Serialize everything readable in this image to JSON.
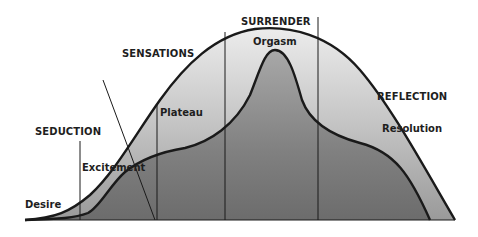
{
  "diagram": {
    "phases": [
      {
        "id": "seduction",
        "label": "SEDUCTION"
      },
      {
        "id": "sensations",
        "label": "SENSATIONS"
      },
      {
        "id": "surrender",
        "label": "SURRENDER"
      },
      {
        "id": "reflection",
        "label": "REFLECTION"
      }
    ],
    "stages": [
      {
        "id": "desire",
        "label": "Desire"
      },
      {
        "id": "excitement",
        "label": "Excitement"
      },
      {
        "id": "plateau",
        "label": "Plateau"
      },
      {
        "id": "orgasm",
        "label": "Orgasm"
      },
      {
        "id": "resolution",
        "label": "Resolution"
      }
    ],
    "colors": {
      "outer_fill_top": "#e8e8e8",
      "outer_fill_bottom": "#8a8a8a",
      "inner_fill_top": "#9a9a9a",
      "inner_fill_bottom": "#6a6a6a",
      "stroke": "#1a1a1a"
    }
  }
}
